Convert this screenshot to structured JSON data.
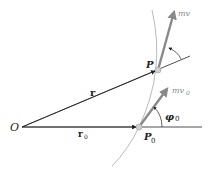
{
  "diagram": {
    "labels": {
      "origin": "O",
      "point_p": "P",
      "point_p0": "P",
      "point_p0_sub": "0",
      "vector_r": "r",
      "vector_r0": "r",
      "vector_r0_sub": "0",
      "momentum": "mv",
      "momentum0": "mv",
      "momentum0_sub": "0",
      "angle_phi0": "φ",
      "angle_phi0_sub": "0"
    },
    "colors": {
      "line": "#222222",
      "arrow": "#8a8a8a",
      "curve": "#a0a0a0",
      "point": "#c8c8c8"
    }
  }
}
